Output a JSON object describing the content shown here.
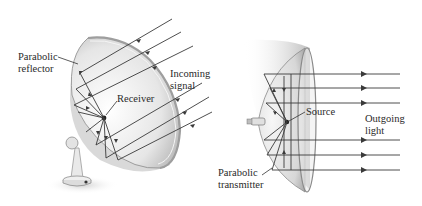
{
  "figure": {
    "left_panel": {
      "title": "Parabolic reflector (receiving dish)",
      "labels": {
        "reflector_line1": "Parabolic",
        "reflector_line2": "reflector",
        "receiver": "Receiver",
        "signal_line1": "Incoming",
        "signal_line2": "signal"
      },
      "incoming_ray_count": 6
    },
    "right_panel": {
      "title": "Parabolic transmitter (light source)",
      "labels": {
        "source": "Source",
        "light_line1": "Outgoing",
        "light_line2": "light",
        "transmitter_line1": "Parabolic",
        "transmitter_line2": "transmitter"
      },
      "outgoing_ray_count": 6
    },
    "colors": {
      "ray": "#3a3a3a",
      "dish_light": "#f2f2f2",
      "dish_shade": "#b5b5b5",
      "text": "#2a2a2a"
    }
  }
}
